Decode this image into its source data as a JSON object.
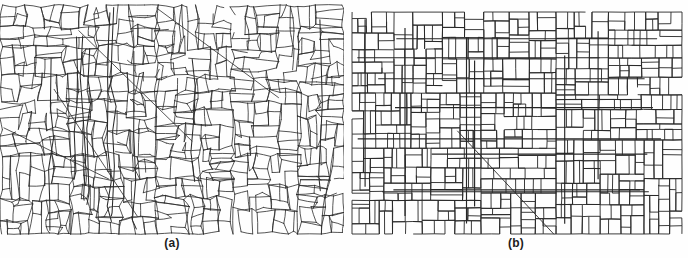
{
  "figure": {
    "kind": "two-panel-map-figure",
    "background_color": "#fefefe",
    "line_color": "#2b2b2b",
    "width": 688,
    "height": 258
  },
  "panels": [
    {
      "id": "a",
      "caption": "(a)",
      "description": "irregular polygonal parcel map",
      "style": "irregular",
      "x": 0,
      "y": 5,
      "width": 344,
      "height": 229,
      "stroke_width": 0.8,
      "seed": 20250111,
      "cells": 520,
      "jitter": 0.62,
      "relax": 2
    },
    {
      "id": "b",
      "caption": "(b)",
      "description": "rectilinear simplification of the same parcel map",
      "style": "rectilinear",
      "x": 352,
      "y": 12,
      "width": 330,
      "height": 222,
      "stroke_width": 0.9,
      "seed": 77341,
      "cells": 560,
      "jitter": 0.18,
      "relax": 3
    }
  ],
  "captions": {
    "a": "(a)",
    "b": "(b)"
  }
}
